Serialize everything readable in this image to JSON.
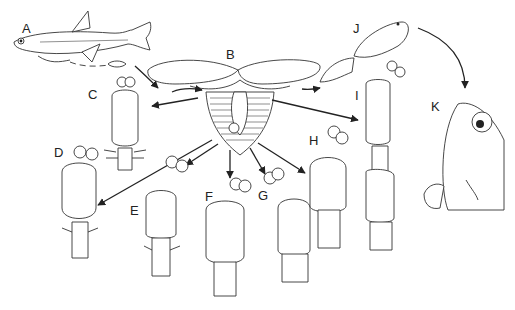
{
  "figure": {
    "type": "scientific-illustration",
    "labels": [
      {
        "id": "A",
        "text": "A",
        "x": 22,
        "y": 22,
        "depicts": "host fish with attached copepod"
      },
      {
        "id": "B",
        "text": "B",
        "x": 226,
        "y": 50,
        "depicts": "egg-bearing adult with egg sacs"
      },
      {
        "id": "C",
        "text": "C",
        "x": 88,
        "y": 89,
        "depicts": "larval stage"
      },
      {
        "id": "D",
        "text": "D",
        "x": 54,
        "y": 147,
        "depicts": "larval stage"
      },
      {
        "id": "E",
        "text": "E",
        "x": 130,
        "y": 205,
        "depicts": "larval stage"
      },
      {
        "id": "F",
        "text": "F",
        "x": 205,
        "y": 190,
        "depicts": "larval stage"
      },
      {
        "id": "G",
        "text": "G",
        "x": 258,
        "y": 189,
        "depicts": "larval stage"
      },
      {
        "id": "H",
        "text": "H",
        "x": 309,
        "y": 134,
        "depicts": "larval stage"
      },
      {
        "id": "I",
        "text": "I",
        "x": 353,
        "y": 90,
        "depicts": "elongated pre-adult"
      },
      {
        "id": "J",
        "text": "J",
        "x": 353,
        "y": 22,
        "depicts": "adult copepod"
      },
      {
        "id": "K",
        "text": "K",
        "x": 431,
        "y": 102,
        "depicts": "fish head with attached parasite"
      }
    ]
  }
}
